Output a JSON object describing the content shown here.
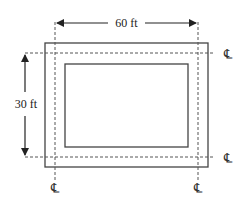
{
  "diagram": {
    "type": "plan view with centerlines",
    "labels": {
      "width_dimension": "60 ft",
      "height_dimension": "30 ft"
    },
    "centerline_symbol": "℄",
    "centerlines": {
      "top": "℄",
      "bottom_right": "℄",
      "left_bottom": "℄",
      "right_bottom": "℄"
    },
    "colors": {
      "line": "#444444",
      "dashed": "#555555",
      "background": "#ffffff"
    }
  }
}
